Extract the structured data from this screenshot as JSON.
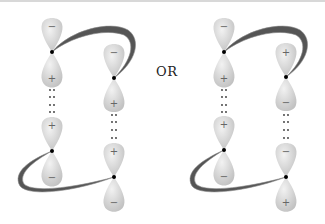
{
  "connector_label": "OR",
  "colors": {
    "lobe_light": "#ececec",
    "lobe_dark": "#c4c4c4",
    "ribbon": "#555555",
    "ribbon_edge": "#8a8a8a",
    "node": "#000000",
    "sign": "#666666"
  },
  "diagrams": [
    {
      "name": "left-diagram",
      "orbitals": [
        {
          "column": "left",
          "position": "upper",
          "top_sign": "−",
          "bottom_sign": "+"
        },
        {
          "column": "left",
          "position": "lower",
          "top_sign": "+",
          "bottom_sign": "−"
        },
        {
          "column": "right",
          "position": "upper",
          "top_sign": "−",
          "bottom_sign": "+"
        },
        {
          "column": "right",
          "position": "lower",
          "top_sign": "+",
          "bottom_sign": "−"
        }
      ]
    },
    {
      "name": "right-diagram",
      "orbitals": [
        {
          "column": "left",
          "position": "upper",
          "top_sign": "−",
          "bottom_sign": "+"
        },
        {
          "column": "left",
          "position": "lower",
          "top_sign": "+",
          "bottom_sign": "−"
        },
        {
          "column": "right",
          "position": "upper",
          "top_sign": "+",
          "bottom_sign": "−"
        },
        {
          "column": "right",
          "position": "lower",
          "top_sign": "−",
          "bottom_sign": "+"
        }
      ]
    }
  ]
}
